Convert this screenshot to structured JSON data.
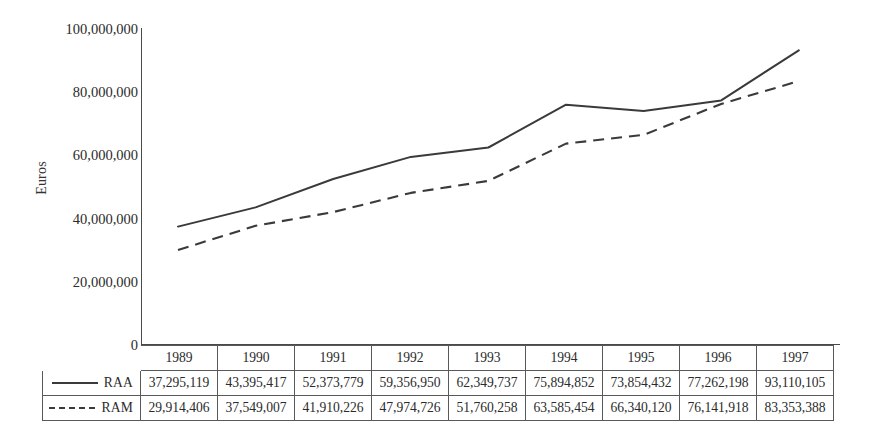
{
  "chart_data": {
    "type": "line",
    "title": "",
    "xlabel": "",
    "ylabel": "Euros",
    "categories": [
      "1989",
      "1990",
      "1991",
      "1992",
      "1993",
      "1994",
      "1995",
      "1996",
      "1997"
    ],
    "ylim": [
      0,
      100000000
    ],
    "yticks": [
      0,
      20000000,
      40000000,
      60000000,
      80000000,
      100000000
    ],
    "ytick_labels": [
      "0",
      "20,000,000",
      "40,000,000",
      "60,000,000",
      "80,000,000",
      "100,000,000"
    ],
    "grid": false,
    "legend_position": "table-row-labels",
    "series": [
      {
        "name": "RAA",
        "style": "solid",
        "color": "#3a3a3a",
        "values": [
          37295119,
          43395417,
          52373779,
          59356950,
          62349737,
          75894852,
          73854432,
          77262198,
          93110105
        ],
        "value_labels": [
          "37,295,119",
          "43,395,417",
          "52,373,779",
          "59,356,950",
          "62,349,737",
          "75,894,852",
          "73,854,432",
          "77,262,198",
          "93,110,105"
        ]
      },
      {
        "name": "RAM",
        "style": "dashed",
        "color": "#3a3a3a",
        "values": [
          29914406,
          37549007,
          41910226,
          47974726,
          51760258,
          63585454,
          66340120,
          76141918,
          83353388
        ],
        "value_labels": [
          "29,914,406",
          "37,549,007",
          "41,910,226",
          "47,974,726",
          "51,760,258",
          "63,585,454",
          "66,340,120",
          "76,141,918",
          "83,353,388"
        ]
      }
    ]
  },
  "axis": {
    "y_title": "Euros",
    "y_labels": [
      "100,000,000",
      "80,000,000",
      "60,000,000",
      "40,000,000",
      "20,000,000",
      "0"
    ]
  },
  "table": {
    "years": [
      "1989",
      "1990",
      "1991",
      "1992",
      "1993",
      "1994",
      "1995",
      "1996",
      "1997"
    ],
    "rows": [
      {
        "label": "RAA",
        "swatch": "solid-line-icon",
        "values": [
          "37,295,119",
          "43,395,417",
          "52,373,779",
          "59,356,950",
          "62,349,737",
          "75,894,852",
          "73,854,432",
          "77,262,198",
          "93,110,105"
        ]
      },
      {
        "label": "RAM",
        "swatch": "dashed-line-icon",
        "values": [
          "29,914,406",
          "37,549,007",
          "41,910,226",
          "47,974,726",
          "51,760,258",
          "63,585,454",
          "66,340,120",
          "76,141,918",
          "83,353,388"
        ]
      }
    ]
  }
}
